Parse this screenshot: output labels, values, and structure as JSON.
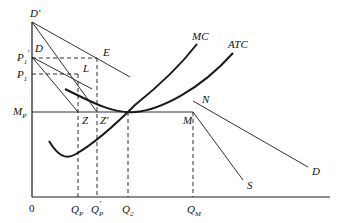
{
  "diagram": {
    "type": "economics-cost-curves",
    "labels": {
      "origin": "0",
      "d_prime": "D'",
      "d_upper": "D",
      "p1_prime": "P",
      "p1_prime_sub": "1",
      "p1_prime_sup": "'",
      "p1": "P",
      "p1_sub": "1",
      "mp": "M",
      "mp_sub": "P",
      "e": "E",
      "l": "L",
      "z": "Z",
      "z_prime": "Z'",
      "mc": "MC",
      "atc": "ATC",
      "n": "N",
      "m": "M",
      "s": "S",
      "d_lower": "D",
      "qp": "Q",
      "qp_sub": "P",
      "qp_prime": "Q",
      "qp_prime_sub": "P",
      "qp_prime_sup": "'",
      "q2": "Q",
      "q2_sub": "2",
      "qm": "Q",
      "qm_sub": "M"
    },
    "colors": {
      "line": "#1a1a1a",
      "background": "#ffffff"
    }
  }
}
